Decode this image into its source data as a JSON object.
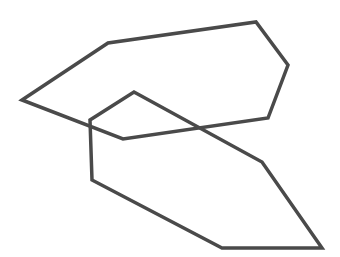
{
  "figure": {
    "width": 340,
    "height": 257,
    "background": "#ffffff",
    "stroke_color": "#4a4a4a",
    "stroke_width": 3.5
  },
  "shapes": [
    {
      "name": "polygon-upper",
      "type": "hexagon",
      "points": [
        [
          22,
          100
        ],
        [
          108,
          43
        ],
        [
          256,
          22
        ],
        [
          288,
          65
        ],
        [
          268,
          118
        ],
        [
          123,
          139
        ]
      ]
    },
    {
      "name": "polygon-lower",
      "type": "hexagon",
      "points": [
        [
          134,
          92
        ],
        [
          262,
          162
        ],
        [
          322,
          248
        ],
        [
          222,
          248
        ],
        [
          92,
          180
        ],
        [
          90,
          120
        ]
      ]
    }
  ]
}
